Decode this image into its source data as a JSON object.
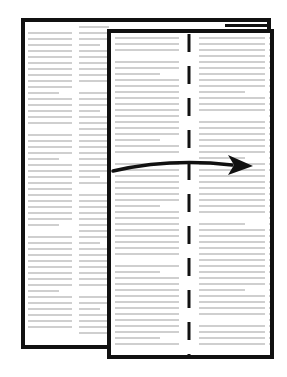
{
  "figure": {
    "fold_direction": "left-to-right",
    "elements": {
      "back_page": {
        "label": "back page"
      },
      "front_page": {
        "label": "front page"
      },
      "fold_line": {
        "style": "dashed",
        "color": "#111111"
      },
      "arrow": {
        "direction": "right",
        "color": "#111111"
      }
    },
    "colors": {
      "outline": "#111111",
      "text_placeholder": "#cfcfcf",
      "background": "#ffffff"
    }
  }
}
